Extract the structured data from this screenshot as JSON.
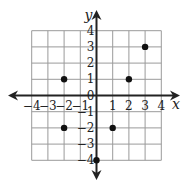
{
  "chart_data": {
    "type": "scatter",
    "title": "",
    "xlabel": "x",
    "ylabel": "y",
    "xlim": [
      -4,
      4
    ],
    "ylim": [
      -4,
      4
    ],
    "grid": true,
    "x_ticks": [
      "−4",
      "−3",
      "−2",
      "−1",
      "0",
      "1",
      "2",
      "3",
      "4"
    ],
    "y_ticks": [
      "−4",
      "−3",
      "−2",
      "−1",
      "0",
      "1",
      "2",
      "3",
      "4"
    ],
    "x_tick_values": [
      -4,
      -3,
      -2,
      -1,
      1,
      2,
      3,
      4
    ],
    "y_tick_values": [
      -4,
      -3,
      -2,
      -1,
      0,
      1,
      2,
      3,
      4
    ],
    "points": [
      {
        "x": -2,
        "y": 1
      },
      {
        "x": -2,
        "y": -2
      },
      {
        "x": 2,
        "y": 1
      },
      {
        "x": 3,
        "y": 3
      },
      {
        "x": 1,
        "y": -2
      },
      {
        "x": 0,
        "y": -4
      }
    ]
  }
}
